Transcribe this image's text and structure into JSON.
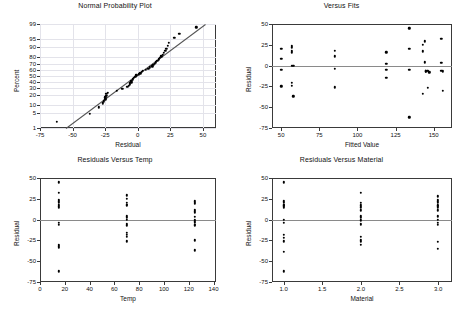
{
  "figure": {
    "kind": "minitab-four-in-one-residual-plots",
    "width": 455,
    "height": 309,
    "background": "#ffffff",
    "marker_color": "#000000",
    "axis_color": "#3a3a3a",
    "grid_color": "#e3e3ea",
    "zero_line_color": "#8a8a8a",
    "reference_line_color": "#555555"
  },
  "chart_data": [
    {
      "id": "normal-probability-plot",
      "type": "scatter",
      "title": "Normal Probability Plot",
      "xlabel": "Residual",
      "ylabel": "Percent",
      "xlim": [
        -75,
        60
      ],
      "ylim_percent": [
        1,
        99
      ],
      "xticks": [
        -75,
        -50,
        -25,
        0,
        25,
        50
      ],
      "yticks": [
        1,
        5,
        10,
        20,
        30,
        40,
        50,
        60,
        70,
        80,
        90,
        95,
        99
      ],
      "grid": true,
      "legend": "none",
      "reference_line": {
        "x1": -55,
        "y1": 1,
        "x2": 52,
        "y2": 99
      },
      "x": [
        -62,
        -37,
        -30,
        -27,
        -26,
        -25,
        -25,
        -24,
        -24,
        -23,
        -16,
        -12,
        -8,
        -7,
        -6,
        -6,
        -5,
        -5,
        -4,
        -4,
        -3,
        -2,
        -1,
        1,
        2,
        3,
        4,
        6,
        8,
        9,
        11,
        12,
        13,
        14,
        15,
        16,
        17,
        18,
        19,
        20,
        21,
        22,
        23,
        24,
        28,
        32,
        45
      ],
      "percent": [
        2,
        4.5,
        8,
        11,
        13,
        15,
        17,
        19,
        21,
        23,
        25,
        28,
        31,
        33,
        35,
        37,
        39,
        41,
        43,
        45,
        47,
        49,
        51,
        53,
        55,
        57,
        59,
        61,
        63,
        65,
        67,
        69,
        71,
        73,
        75,
        77,
        79,
        81,
        83,
        85,
        87,
        89,
        91,
        93,
        95.5,
        97,
        98.5
      ]
    },
    {
      "id": "versus-fits",
      "type": "scatter",
      "title": "Versus Fits",
      "xlabel": "Fitted Value",
      "ylabel": "Residual",
      "xlim": [
        44,
        162
      ],
      "ylim": [
        -75,
        50
      ],
      "xticks": [
        50,
        75,
        100,
        125,
        150
      ],
      "yticks": [
        -75,
        -50,
        -25,
        0,
        25,
        50
      ],
      "grid": false,
      "legend": "none",
      "zero_line": 0,
      "x": [
        50,
        50,
        50,
        50,
        57,
        57,
        57,
        57,
        57,
        57,
        57,
        58,
        58,
        85,
        85,
        85,
        85,
        119,
        119,
        119,
        119,
        134,
        134,
        134,
        134,
        143,
        143,
        143,
        144,
        144,
        145,
        145,
        145,
        146,
        146,
        146,
        147,
        155,
        155,
        155,
        156,
        156
      ],
      "y": [
        20,
        8,
        -5,
        -25,
        24,
        22,
        18,
        16,
        0,
        -21,
        -24,
        -37,
        0,
        18,
        11,
        -4,
        -26,
        16,
        2,
        -5,
        -15,
        45,
        20,
        -5,
        -62,
        -34,
        17,
        25,
        29,
        4,
        -6,
        -7,
        -7,
        -6,
        -6,
        -27,
        -8,
        32,
        3,
        -6,
        -7,
        -30
      ]
    },
    {
      "id": "residuals-versus-temp",
      "type": "scatter",
      "title": "Residuals Versus Temp",
      "xlabel": "Temp",
      "ylabel": "Residual",
      "xlim": [
        0,
        142
      ],
      "ylim": [
        -75,
        50
      ],
      "xticks": [
        0,
        20,
        40,
        60,
        80,
        100,
        120,
        140
      ],
      "yticks": [
        -75,
        -50,
        -25,
        0,
        25,
        50
      ],
      "grid": false,
      "legend": "none",
      "zero_line": 0,
      "groups": [
        15,
        70,
        125
      ],
      "x": [
        15,
        15,
        15,
        15,
        15,
        15,
        15,
        15,
        15,
        15,
        15,
        15,
        15,
        15,
        70,
        70,
        70,
        70,
        70,
        70,
        70,
        70,
        70,
        70,
        70,
        70,
        70,
        70,
        125,
        125,
        125,
        125,
        125,
        125,
        125,
        125,
        125,
        125,
        125,
        125,
        125,
        125
      ],
      "y": [
        45,
        32,
        24,
        22,
        20,
        18,
        16,
        14,
        -4,
        -6,
        -30,
        -32,
        -34,
        -62,
        29,
        25,
        20,
        18,
        17,
        4,
        2,
        0,
        -5,
        -7,
        -16,
        -18,
        -21,
        -26,
        22,
        20,
        19,
        12,
        10,
        8,
        3,
        0,
        -2,
        -4,
        -6,
        -7,
        -25,
        -37
      ]
    },
    {
      "id": "residuals-versus-material",
      "type": "scatter",
      "title": "Residuals Versus Material",
      "xlabel": "Material",
      "ylabel": "Residual",
      "xlim": [
        0.85,
        3.18
      ],
      "ylim": [
        -75,
        50
      ],
      "xticks": [
        1.0,
        1.5,
        2.0,
        2.5,
        3.0
      ],
      "yticks": [
        -75,
        -50,
        -25,
        0,
        25,
        50
      ],
      "grid": false,
      "legend": "none",
      "zero_line": 0,
      "groups": [
        1.0,
        2.0,
        3.0
      ],
      "x": [
        1,
        1,
        1,
        1,
        1,
        1,
        1,
        1,
        1,
        1,
        1,
        1,
        1,
        1,
        2,
        2,
        2,
        2,
        2,
        2,
        2,
        2,
        2,
        2,
        2,
        2,
        2,
        2,
        3,
        3,
        3,
        3,
        3,
        3,
        3,
        3,
        3,
        3,
        3,
        3,
        3,
        3
      ],
      "y": [
        45,
        22,
        20,
        18,
        17,
        16,
        14,
        0,
        -4,
        -18,
        -22,
        -26,
        -39,
        -62,
        32,
        20,
        17,
        15,
        11,
        4,
        2,
        -1,
        -5,
        -6,
        -21,
        -25,
        -27,
        -30,
        28,
        24,
        22,
        20,
        17,
        16,
        14,
        11,
        4,
        0,
        -4,
        -6,
        -27,
        -35
      ]
    }
  ]
}
